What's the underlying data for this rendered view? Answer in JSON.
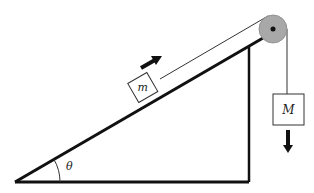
{
  "diagram": {
    "type": "incline-pulley-system",
    "labels": {
      "small_mass": "m",
      "hanging_mass": "M",
      "angle": "θ"
    },
    "colors": {
      "line": "#111111",
      "pulley_fill": "#a8a8a8",
      "background": "#ffffff"
    },
    "arrows": {
      "small_mass_direction": "up-the-incline",
      "hanging_mass_direction": "down"
    }
  }
}
